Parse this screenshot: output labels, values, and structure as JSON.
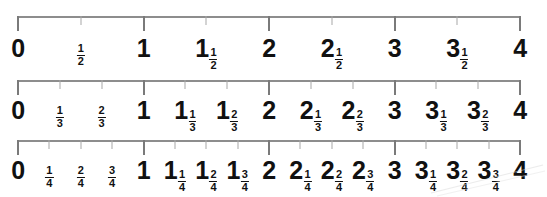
{
  "page": {
    "background_color": "#ffffff",
    "axis_color": "#8d8d8d",
    "major_tick_color": "#7a7a7a",
    "minor_tick_color": "#a8a8a8",
    "label_color": "#111111",
    "axis_start_x": 18,
    "axis_end_x": 520
  },
  "chart_data": {
    "type": "line",
    "xlabel": "",
    "ylabel": "",
    "xlim": [
      0,
      4
    ],
    "grid": false,
    "legend": false,
    "lines": [
      {
        "name": "halves",
        "denominator": 2,
        "min": 0,
        "max": 4,
        "divisions_per_unit": 2,
        "ticks": [
          {
            "value": 0,
            "type": "major",
            "label": "0",
            "whole": "0",
            "numerator": null,
            "denominator": null
          },
          {
            "value": 0.5,
            "type": "minor",
            "label": "1/2",
            "whole": "",
            "numerator": "1",
            "denominator": "2"
          },
          {
            "value": 1,
            "type": "major",
            "label": "1",
            "whole": "1",
            "numerator": null,
            "denominator": null
          },
          {
            "value": 1.5,
            "type": "minor",
            "label": "1 1/2",
            "whole": "1",
            "numerator": "1",
            "denominator": "2"
          },
          {
            "value": 2,
            "type": "major",
            "label": "2",
            "whole": "2",
            "numerator": null,
            "denominator": null
          },
          {
            "value": 2.5,
            "type": "minor",
            "label": "2 1/2",
            "whole": "2",
            "numerator": "1",
            "denominator": "2"
          },
          {
            "value": 3,
            "type": "major",
            "label": "3",
            "whole": "3",
            "numerator": null,
            "denominator": null
          },
          {
            "value": 3.5,
            "type": "minor",
            "label": "3 1/2",
            "whole": "3",
            "numerator": "1",
            "denominator": "2"
          },
          {
            "value": 4,
            "type": "major",
            "label": "4",
            "whole": "4",
            "numerator": null,
            "denominator": null
          }
        ]
      },
      {
        "name": "thirds",
        "denominator": 3,
        "min": 0,
        "max": 4,
        "divisions_per_unit": 3,
        "ticks": [
          {
            "value": 0,
            "type": "major",
            "label": "0",
            "whole": "0",
            "numerator": null,
            "denominator": null
          },
          {
            "value": 0.3333,
            "type": "minor",
            "label": "1/3",
            "whole": "",
            "numerator": "1",
            "denominator": "3"
          },
          {
            "value": 0.6667,
            "type": "minor",
            "label": "2/3",
            "whole": "",
            "numerator": "2",
            "denominator": "3"
          },
          {
            "value": 1,
            "type": "major",
            "label": "1",
            "whole": "1",
            "numerator": null,
            "denominator": null
          },
          {
            "value": 1.3333,
            "type": "minor",
            "label": "1 1/3",
            "whole": "1",
            "numerator": "1",
            "denominator": "3"
          },
          {
            "value": 1.6667,
            "type": "minor",
            "label": "1 2/3",
            "whole": "1",
            "numerator": "2",
            "denominator": "3"
          },
          {
            "value": 2,
            "type": "major",
            "label": "2",
            "whole": "2",
            "numerator": null,
            "denominator": null
          },
          {
            "value": 2.3333,
            "type": "minor",
            "label": "2 1/3",
            "whole": "2",
            "numerator": "1",
            "denominator": "3"
          },
          {
            "value": 2.6667,
            "type": "minor",
            "label": "2 2/3",
            "whole": "2",
            "numerator": "2",
            "denominator": "3"
          },
          {
            "value": 3,
            "type": "major",
            "label": "3",
            "whole": "3",
            "numerator": null,
            "denominator": null
          },
          {
            "value": 3.3333,
            "type": "minor",
            "label": "3 1/3",
            "whole": "3",
            "numerator": "1",
            "denominator": "3"
          },
          {
            "value": 3.6667,
            "type": "minor",
            "label": "3 2/3",
            "whole": "3",
            "numerator": "2",
            "denominator": "3"
          },
          {
            "value": 4,
            "type": "major",
            "label": "4",
            "whole": "4",
            "numerator": null,
            "denominator": null
          }
        ]
      },
      {
        "name": "quarters",
        "denominator": 4,
        "min": 0,
        "max": 4,
        "divisions_per_unit": 4,
        "ticks": [
          {
            "value": 0,
            "type": "major",
            "label": "0",
            "whole": "0",
            "numerator": null,
            "denominator": null
          },
          {
            "value": 0.25,
            "type": "minor",
            "label": "1/4",
            "whole": "",
            "numerator": "1",
            "denominator": "4"
          },
          {
            "value": 0.5,
            "type": "minor",
            "label": "2/4",
            "whole": "",
            "numerator": "2",
            "denominator": "4"
          },
          {
            "value": 0.75,
            "type": "minor",
            "label": "3/4",
            "whole": "",
            "numerator": "3",
            "denominator": "4"
          },
          {
            "value": 1,
            "type": "major",
            "label": "1",
            "whole": "1",
            "numerator": null,
            "denominator": null
          },
          {
            "value": 1.25,
            "type": "minor",
            "label": "1 1/4",
            "whole": "1",
            "numerator": "1",
            "denominator": "4"
          },
          {
            "value": 1.5,
            "type": "minor",
            "label": "1 2/4",
            "whole": "1",
            "numerator": "2",
            "denominator": "4"
          },
          {
            "value": 1.75,
            "type": "minor",
            "label": "1 3/4",
            "whole": "1",
            "numerator": "3",
            "denominator": "4"
          },
          {
            "value": 2,
            "type": "major",
            "label": "2",
            "whole": "2",
            "numerator": null,
            "denominator": null
          },
          {
            "value": 2.25,
            "type": "minor",
            "label": "2 1/4",
            "whole": "2",
            "numerator": "1",
            "denominator": "4"
          },
          {
            "value": 2.5,
            "type": "minor",
            "label": "2 2/4",
            "whole": "2",
            "numerator": "2",
            "denominator": "4"
          },
          {
            "value": 2.75,
            "type": "minor",
            "label": "2 3/4",
            "whole": "2",
            "numerator": "3",
            "denominator": "4"
          },
          {
            "value": 3,
            "type": "major",
            "label": "3",
            "whole": "3",
            "numerator": null,
            "denominator": null
          },
          {
            "value": 3.25,
            "type": "minor",
            "label": "3 1/4",
            "whole": "3",
            "numerator": "1",
            "denominator": "4"
          },
          {
            "value": 3.5,
            "type": "minor",
            "label": "3 2/4",
            "whole": "3",
            "numerator": "2",
            "denominator": "4"
          },
          {
            "value": 3.75,
            "type": "minor",
            "label": "3 3/4",
            "whole": "3",
            "numerator": "3",
            "denominator": "4"
          },
          {
            "value": 4,
            "type": "major",
            "label": "4",
            "whole": "4",
            "numerator": null,
            "denominator": null
          }
        ]
      }
    ]
  }
}
